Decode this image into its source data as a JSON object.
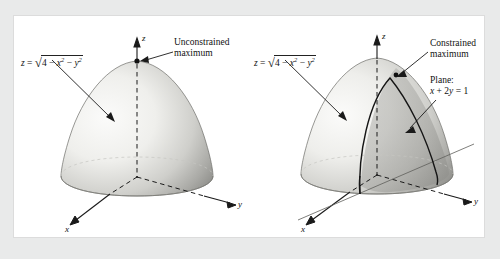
{
  "figure": {
    "background_color": "#e9eaea",
    "panel_color": "#ffffff",
    "surface_color_light": "#f2f2f0",
    "surface_color_dark": "#9a9a97",
    "stroke_color": "#1a1a1a"
  },
  "left_panel": {
    "surface_equation": {
      "lhs": "z",
      "equals": "=",
      "radicand_a": "4",
      "minus1": "−",
      "term_x": "x",
      "exp_x": "2",
      "minus2": "−",
      "term_y": "y",
      "exp_y": "2"
    },
    "annotation": {
      "line1": "Unconstrained",
      "line2": "maximum"
    },
    "axes": {
      "z": "z",
      "y": "y",
      "x": "x"
    }
  },
  "right_panel": {
    "surface_equation": {
      "lhs": "z",
      "equals": "=",
      "radicand_a": "4",
      "minus1": "−",
      "term_x": "x",
      "exp_x": "2",
      "minus2": "−",
      "term_y": "y",
      "exp_y": "2"
    },
    "annotation": {
      "line1": "Constrained",
      "line2": "maximum"
    },
    "plane_label": {
      "title": "Plane:",
      "equation_x": "x",
      "plus": "+",
      "coef": "2",
      "equation_y": "y",
      "eq": "=",
      "rhs": "1"
    },
    "axes": {
      "z": "z",
      "y": "y",
      "x": "x"
    }
  }
}
